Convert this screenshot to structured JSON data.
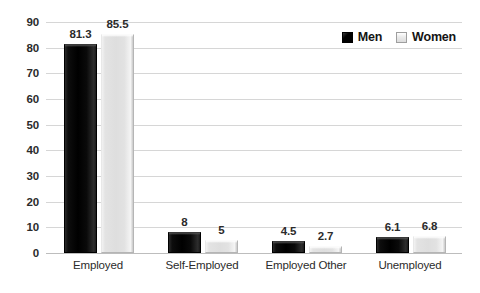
{
  "chart_data": {
    "type": "bar",
    "title": "",
    "subtitle": "",
    "xlabel": "",
    "ylabel": "",
    "categories": [
      "Employed",
      "Self-Employed",
      "Employed Other",
      "Unemployed"
    ],
    "series": [
      {
        "name": "Men",
        "color": "#000000",
        "values": [
          81.3,
          8,
          4.5,
          6.1
        ],
        "value_labels": [
          "81.3",
          "8",
          "4.5",
          "6.1"
        ]
      },
      {
        "name": "Women",
        "color": "#e0e0e0",
        "values": [
          85.5,
          5,
          2.7,
          6.8
        ],
        "value_labels": [
          "85.5",
          "5",
          "2.7",
          "6.8"
        ]
      }
    ],
    "ylim": [
      0,
      90
    ],
    "ytick_step": 10,
    "yticks": [
      "0",
      "10",
      "20",
      "30",
      "40",
      "50",
      "60",
      "70",
      "80",
      "90"
    ],
    "grid": true,
    "grid_axis": "y",
    "legend": true,
    "legend_position": "top-right",
    "data_labels": true,
    "background_color": "#ffffff",
    "gridline_color": "#d6d6d6",
    "text_color": "#2b2b2b"
  },
  "legend": {
    "items": [
      {
        "label": "Men",
        "swatch": "men"
      },
      {
        "label": "Women",
        "swatch": "women"
      }
    ]
  }
}
